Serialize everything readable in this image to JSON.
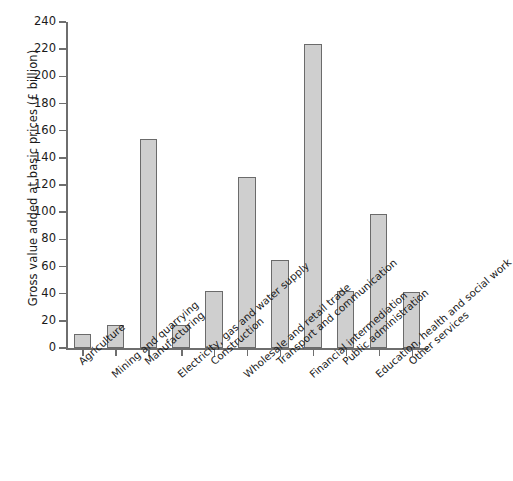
{
  "chart_data": {
    "type": "bar",
    "title": "",
    "subtitle": "",
    "xlabel": "",
    "ylabel": "Gross value added at basic prices (£ billion)",
    "ylim": [
      0,
      240
    ],
    "ytick_step": 20,
    "yticks": [
      0,
      20,
      40,
      60,
      80,
      100,
      120,
      140,
      160,
      180,
      200,
      220,
      240
    ],
    "grid": false,
    "legend": null,
    "legend_position": "none",
    "bar_fill_color": "#cfcfcf",
    "bar_edge_color": "#6b6b6b",
    "axis_color": "#6e6e6e",
    "categories": [
      "Agriculture",
      "Mining and quarrying",
      "Manufacturing",
      "Electricity, gas and water supply",
      "Construction",
      "Wholesale and retail trade",
      "Transport and communication",
      "Financial intermediation",
      "Public administration",
      "Education, health and social work",
      "Other services"
    ],
    "values": [
      10,
      17,
      154,
      17,
      42,
      126,
      65,
      224,
      42,
      99,
      41
    ]
  }
}
